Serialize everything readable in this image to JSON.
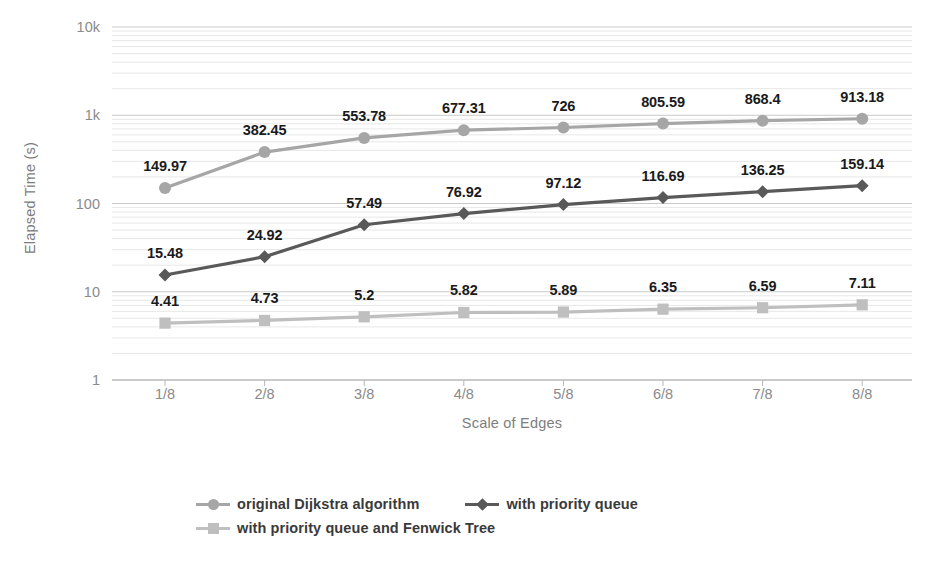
{
  "chart_data": {
    "type": "line",
    "title": "",
    "xlabel": "Scale of Edges",
    "ylabel": "Elapsed Time (s)",
    "yscale": "log",
    "ylim": [
      1,
      10000
    ],
    "grid": true,
    "legend_position": "bottom",
    "categories": [
      "1/8",
      "2/8",
      "3/8",
      "4/8",
      "5/8",
      "6/8",
      "7/8",
      "8/8"
    ],
    "ytick_labels": [
      "1",
      "10",
      "100",
      "1k",
      "10k"
    ],
    "ytick_values": [
      1,
      10,
      100,
      1000,
      10000
    ],
    "series": [
      {
        "name": "original Dijkstra algorithm",
        "marker": "circle",
        "color": "#a6a6a6",
        "values": [
          149.97,
          382.45,
          553.78,
          677.31,
          726,
          805.59,
          868.4,
          913.18
        ],
        "labels": [
          "149.97",
          "382.45",
          "553.78",
          "677.31",
          "726",
          "805.59",
          "868.4",
          "913.18"
        ]
      },
      {
        "name": "with priority queue",
        "marker": "diamond",
        "color": "#595959",
        "values": [
          15.48,
          24.92,
          57.49,
          76.92,
          97.12,
          116.69,
          136.25,
          159.14
        ],
        "labels": [
          "15.48",
          "24.92",
          "57.49",
          "76.92",
          "97.12",
          "116.69",
          "136.25",
          "159.14"
        ]
      },
      {
        "name": "with priority queue and Fenwick Tree",
        "marker": "square",
        "color": "#bfbfbf",
        "values": [
          4.41,
          4.73,
          5.2,
          5.82,
          5.89,
          6.35,
          6.59,
          7.11
        ],
        "labels": [
          "4.41",
          "4.73",
          "5.2",
          "5.82",
          "5.89",
          "6.35",
          "6.59",
          "7.11"
        ]
      }
    ]
  },
  "axis": {
    "y_title": "Elapsed Time (s)",
    "x_title": "Scale of Edges"
  },
  "legend": {
    "items": [
      {
        "label": "original Dijkstra algorithm",
        "marker": "circle-marker",
        "color": "#a6a6a6"
      },
      {
        "label": "with priority queue",
        "marker": "diamond-marker",
        "color": "#595959"
      },
      {
        "label": "with priority queue and Fenwick Tree",
        "marker": "square-marker",
        "color": "#bfbfbf"
      }
    ]
  }
}
